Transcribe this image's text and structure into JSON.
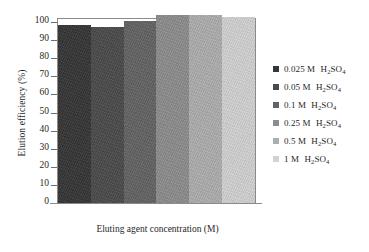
{
  "chart_data": {
    "type": "bar",
    "title": "",
    "xlabel": "Eluting agent concentration (M)",
    "ylabel": "Elution efficiency (%)",
    "ylim": [
      0,
      100
    ],
    "yticks": [
      0,
      10,
      20,
      30,
      40,
      50,
      60,
      70,
      80,
      90,
      100
    ],
    "ytick_labels": [
      "0",
      "10",
      "20",
      "30",
      "40",
      "50",
      "60",
      "70",
      "80",
      "90",
      "100"
    ],
    "categories": [
      "0.025 M H2SO4",
      "0.05 M H2SO4",
      "0.1 M H2SO4",
      "0.25 M H2SO4",
      "0.5 M H2SO4",
      "1 M H2SO4"
    ],
    "values": [
      98.5,
      97,
      100.5,
      104,
      104,
      102.5
    ],
    "grid": false,
    "legend_position": "right",
    "series": [
      {
        "name": "Elution efficiency (%)",
        "values": [
          98.5,
          97,
          100.5,
          104,
          104,
          102.5
        ]
      }
    ],
    "colors": [
      "#363636",
      "#4b4b4b",
      "#636363",
      "#8d8d8d",
      "#aeaeae",
      "#d2d2d2"
    ]
  },
  "legend": {
    "items": [
      {
        "conc": "0.025 M",
        "formula_pre": "H",
        "sub1": "2",
        "mid": "SO",
        "sub2": "4",
        "swatch": "#363636"
      },
      {
        "conc": "0.05 M",
        "formula_pre": "H",
        "sub1": "2",
        "mid": "SO",
        "sub2": "4",
        "swatch": "#4b4b4b"
      },
      {
        "conc": "0.1 M",
        "formula_pre": "H",
        "sub1": "2",
        "mid": "SO",
        "sub2": "4",
        "swatch": "#636363"
      },
      {
        "conc": "0.25 M",
        "formula_pre": "H",
        "sub1": "2",
        "mid": "SO",
        "sub2": "4",
        "swatch": "#8d8d8d"
      },
      {
        "conc": "0.5 M",
        "formula_pre": "H",
        "sub1": "2",
        "mid": "SO",
        "sub2": "4",
        "swatch": "#aeaeae"
      },
      {
        "conc": "1 M",
        "formula_pre": "H",
        "sub1": "2",
        "mid": "SO",
        "sub2": "4",
        "swatch": "#d2d2d2"
      }
    ]
  },
  "axes": {
    "y_title": "Elution efficiency (%)",
    "x_title": "Eluting agent concentration (M)"
  }
}
